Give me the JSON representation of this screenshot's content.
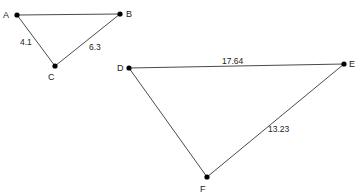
{
  "diagram": {
    "type": "geometry-similar-triangles",
    "triangles": [
      {
        "name": "ABC",
        "vertices": [
          {
            "id": "A",
            "label": "A",
            "x": 17,
            "y": 15,
            "lx": 3,
            "ly": 18
          },
          {
            "id": "B",
            "label": "B",
            "x": 120,
            "y": 14,
            "lx": 126,
            "ly": 17
          },
          {
            "id": "C",
            "label": "C",
            "x": 55,
            "y": 66,
            "lx": 48,
            "ly": 80
          }
        ],
        "edges": [
          {
            "from": "A",
            "to": "B",
            "label": "",
            "lx": 0,
            "ly": 0
          },
          {
            "from": "A",
            "to": "C",
            "label": "4.1",
            "lx": 20,
            "ly": 45
          },
          {
            "from": "C",
            "to": "B",
            "label": "6.3",
            "lx": 89,
            "ly": 50
          }
        ]
      },
      {
        "name": "DEF",
        "vertices": [
          {
            "id": "D",
            "label": "D",
            "x": 129,
            "y": 68,
            "lx": 117,
            "ly": 71
          },
          {
            "id": "E",
            "label": "E",
            "x": 344,
            "y": 64,
            "lx": 349,
            "ly": 67
          },
          {
            "id": "F",
            "label": "F",
            "x": 207,
            "y": 177,
            "lx": 200,
            "ly": 192
          }
        ],
        "edges": [
          {
            "from": "D",
            "to": "E",
            "label": "17.64",
            "lx": 222,
            "ly": 64
          },
          {
            "from": "D",
            "to": "F",
            "label": "",
            "lx": 0,
            "ly": 0
          },
          {
            "from": "F",
            "to": "E",
            "label": "13.23",
            "lx": 268,
            "ly": 132
          }
        ]
      }
    ]
  }
}
